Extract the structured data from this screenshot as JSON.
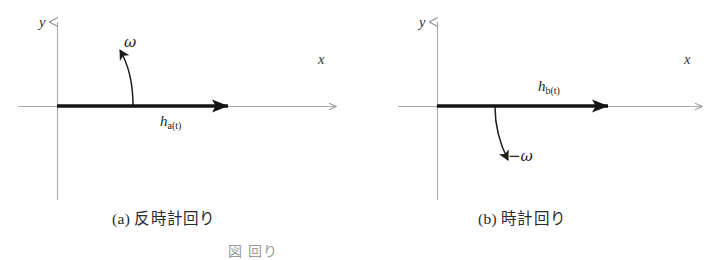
{
  "figure": {
    "panels": [
      {
        "id": "panel-a",
        "caption": "(a) 反時計回り",
        "axis_x_label": "x",
        "axis_y_label": "y",
        "vector_label_base": "h",
        "vector_label_sub": "a(t)",
        "rotation_label": "ω",
        "rotation_direction": "counterclockwise"
      },
      {
        "id": "panel-b",
        "caption": "(b) 時計回り",
        "axis_x_label": "x",
        "axis_y_label": "y",
        "vector_label_base": "h",
        "vector_label_sub": "b(t)",
        "rotation_label": "−ω",
        "rotation_direction": "clockwise"
      }
    ],
    "figure_caption": "図 回り",
    "colors": {
      "axis": "#a8a8a8",
      "vector": "#1a1a1a",
      "text": "#2a2a2a",
      "faint_caption": "#9a9a9a",
      "background": "#ffffff"
    }
  }
}
